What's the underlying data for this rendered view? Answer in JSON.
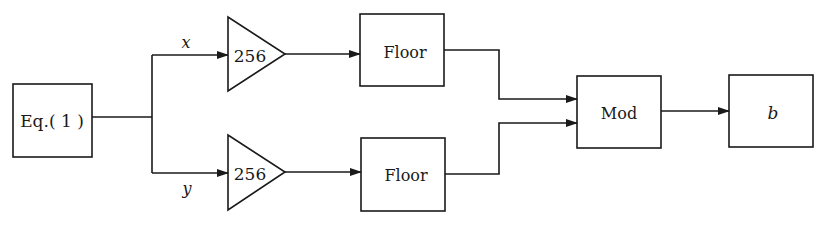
{
  "diagram": {
    "source_block": {
      "label": "Eq.( 1 )"
    },
    "branches": [
      {
        "var_label": "x",
        "gain_label": "256",
        "op_label": "Floor"
      },
      {
        "var_label": "y",
        "gain_label": "256",
        "op_label": "Floor"
      }
    ],
    "combiner": {
      "label": "Mod"
    },
    "output_block": {
      "label": "b"
    },
    "colors": {
      "stroke": "#1a1a1a",
      "background": "#ffffff"
    }
  }
}
